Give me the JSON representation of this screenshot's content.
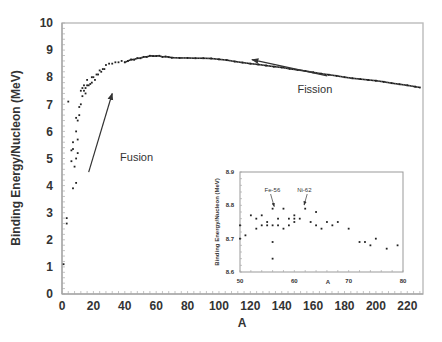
{
  "chart_data": [
    {
      "type": "scatter",
      "title": "",
      "xlabel": "A",
      "ylabel": "Binding Energy/Nucleon (MeV)",
      "xlim": [
        0,
        230
      ],
      "ylim": [
        0,
        10
      ],
      "xticks": [
        0,
        20,
        40,
        60,
        80,
        100,
        120,
        140,
        160,
        180,
        200,
        220
      ],
      "yticks": [
        0,
        1,
        2,
        3,
        4,
        5,
        6,
        7,
        8,
        9,
        10
      ],
      "grid": false,
      "annotations": [
        {
          "text": "Fusion",
          "x": 37,
          "y": 4.9,
          "arrow_from": [
            17,
            4.5
          ],
          "arrow_to": [
            32,
            7.4
          ]
        },
        {
          "text": "Fission",
          "x": 150,
          "y": 7.4,
          "arrow_from": [
            169,
            8.05
          ],
          "arrow_to": [
            121,
            8.65
          ]
        }
      ],
      "points": [
        [
          1,
          1.1
        ],
        [
          3,
          2.6
        ],
        [
          3,
          2.8
        ],
        [
          4,
          7.1
        ],
        [
          6,
          5.3
        ],
        [
          6,
          4.9
        ],
        [
          7,
          5.6
        ],
        [
          7,
          5.35
        ],
        [
          8,
          4.7
        ],
        [
          9,
          5.0
        ],
        [
          7,
          3.9
        ],
        [
          9,
          4.1
        ],
        [
          9,
          6.5
        ],
        [
          9,
          6.0
        ],
        [
          10,
          6.4
        ],
        [
          10,
          5.7
        ],
        [
          10,
          5.2
        ],
        [
          11,
          6.9
        ],
        [
          11,
          6.6
        ],
        [
          12,
          7.5
        ],
        [
          12,
          7.0
        ],
        [
          13,
          7.6
        ],
        [
          13,
          7.3
        ],
        [
          14,
          7.5
        ],
        [
          14,
          7.7
        ],
        [
          15,
          7.4
        ],
        [
          15,
          7.6
        ],
        [
          16,
          7.9
        ],
        [
          16,
          7.7
        ],
        [
          17,
          7.7
        ],
        [
          18,
          7.75
        ],
        [
          19,
          8.0
        ],
        [
          19,
          7.8
        ],
        [
          20,
          8.0
        ],
        [
          21,
          7.9
        ],
        [
          22,
          8.1
        ],
        [
          23,
          8.1
        ],
        [
          24,
          8.25
        ],
        [
          25,
          8.2
        ],
        [
          26,
          8.3
        ],
        [
          27,
          8.3
        ],
        [
          28,
          8.45
        ],
        [
          30,
          8.5
        ],
        [
          32,
          8.5
        ],
        [
          34,
          8.55
        ],
        [
          36,
          8.55
        ],
        [
          38,
          8.6
        ],
        [
          40,
          8.55
        ],
        [
          42,
          8.6
        ],
        [
          44,
          8.65
        ],
        [
          46,
          8.65
        ],
        [
          48,
          8.7
        ],
        [
          50,
          8.7
        ],
        [
          52,
          8.75
        ],
        [
          54,
          8.75
        ],
        [
          56,
          8.79
        ],
        [
          58,
          8.78
        ],
        [
          60,
          8.78
        ],
        [
          62,
          8.79
        ],
        [
          64,
          8.75
        ],
        [
          66,
          8.76
        ],
        [
          68,
          8.74
        ],
        [
          70,
          8.72
        ],
        [
          75,
          8.71
        ],
        [
          80,
          8.71
        ],
        [
          85,
          8.7
        ],
        [
          90,
          8.7
        ],
        [
          95,
          8.69
        ],
        [
          100,
          8.66
        ],
        [
          105,
          8.63
        ],
        [
          110,
          8.58
        ],
        [
          115,
          8.54
        ],
        [
          120,
          8.5
        ],
        [
          125,
          8.47
        ],
        [
          130,
          8.43
        ],
        [
          135,
          8.39
        ],
        [
          140,
          8.36
        ],
        [
          145,
          8.31
        ],
        [
          150,
          8.27
        ],
        [
          155,
          8.23
        ],
        [
          160,
          8.18
        ],
        [
          165,
          8.13
        ],
        [
          170,
          8.09
        ],
        [
          175,
          8.05
        ],
        [
          180,
          8.0
        ],
        [
          185,
          7.96
        ],
        [
          190,
          7.93
        ],
        [
          195,
          7.9
        ],
        [
          200,
          7.87
        ],
        [
          205,
          7.83
        ],
        [
          210,
          7.78
        ],
        [
          215,
          7.74
        ],
        [
          220,
          7.7
        ],
        [
          225,
          7.65
        ],
        [
          228,
          7.62
        ]
      ]
    },
    {
      "type": "scatter",
      "title": "",
      "xlabel": "A",
      "ylabel": "Binding Energy/Nucleon (MeV)",
      "xlim": [
        50,
        80
      ],
      "ylim": [
        8.6,
        8.9
      ],
      "xticks": [
        50,
        60,
        70,
        80
      ],
      "yticks": [
        8.6,
        8.7,
        8.8,
        8.9
      ],
      "grid": false,
      "annotations": [
        {
          "text": "Fe-56",
          "x": 56,
          "y": 8.84
        },
        {
          "text": "Ni-62",
          "x": 62,
          "y": 8.84
        }
      ],
      "points": [
        [
          50,
          8.74
        ],
        [
          50,
          8.7
        ],
        [
          51,
          8.71
        ],
        [
          52,
          8.77
        ],
        [
          53,
          8.76
        ],
        [
          53,
          8.73
        ],
        [
          54,
          8.74
        ],
        [
          54,
          8.77
        ],
        [
          55,
          8.75
        ],
        [
          55,
          8.74
        ],
        [
          56,
          8.79
        ],
        [
          56,
          8.74
        ],
        [
          56,
          8.69
        ],
        [
          56,
          8.64
        ],
        [
          57,
          8.76
        ],
        [
          57,
          8.74
        ],
        [
          58,
          8.79
        ],
        [
          58,
          8.73
        ],
        [
          59,
          8.76
        ],
        [
          59,
          8.74
        ],
        [
          60,
          8.77
        ],
        [
          60,
          8.75
        ],
        [
          60,
          8.76
        ],
        [
          61,
          8.76
        ],
        [
          62,
          8.79
        ],
        [
          63,
          8.75
        ],
        [
          64,
          8.78
        ],
        [
          64,
          8.74
        ],
        [
          65,
          8.73
        ],
        [
          66,
          8.75
        ],
        [
          67,
          8.74
        ],
        [
          68,
          8.75
        ],
        [
          70,
          8.73
        ],
        [
          72,
          8.69
        ],
        [
          73,
          8.69
        ],
        [
          74,
          8.68
        ],
        [
          75,
          8.7
        ],
        [
          77,
          8.67
        ],
        [
          79,
          8.68
        ]
      ]
    }
  ],
  "labels": {
    "main_title": "",
    "inset_ylabel": "Binding Energy/Nucleon (MeV)"
  }
}
